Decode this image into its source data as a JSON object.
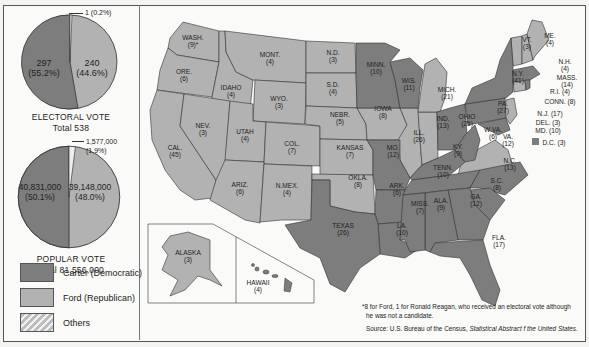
{
  "colors": {
    "carter_democratic": "#7d7d7d",
    "ford_republican": "#b2b2b2",
    "others": "hatched",
    "background": "#fafaf8"
  },
  "electoral_vote": {
    "caption": "ELECTORAL VOTE",
    "total_label": "Total  538",
    "carter": {
      "value": "297",
      "pct": "(55.2%)"
    },
    "ford": {
      "value": "240",
      "pct": "(44.6%)"
    },
    "others": {
      "label": "1 (0.2%)"
    }
  },
  "popular_vote": {
    "caption": "POPULAR VOTE",
    "total_label": "Total  81,556,000",
    "carter": {
      "value": "40,831,000",
      "pct": "(50.1%)"
    },
    "ford": {
      "value": "39,148,000",
      "pct": "(48.0%)"
    },
    "others": {
      "value": "1,577,000",
      "pct": "(1.9%)"
    }
  },
  "legend": [
    {
      "label": "Carter (Democratic)",
      "swatch": "dem"
    },
    {
      "label": "Ford (Republican)",
      "swatch": "rep"
    },
    {
      "label": "Others",
      "swatch": "oth"
    }
  ],
  "states": {
    "wash": {
      "name": "WASH.",
      "ev": "(9)*",
      "winner": "rep"
    },
    "ore": {
      "name": "ORE.",
      "ev": "(6)",
      "winner": "rep"
    },
    "cal": {
      "name": "CAL.",
      "ev": "(45)",
      "winner": "rep"
    },
    "idaho": {
      "name": "IDAHO",
      "ev": "(4)",
      "winner": "rep"
    },
    "nev": {
      "name": "NEV.",
      "ev": "(3)",
      "winner": "rep"
    },
    "mont": {
      "name": "MONT.",
      "ev": "(4)",
      "winner": "rep"
    },
    "wyo": {
      "name": "WYO.",
      "ev": "(3)",
      "winner": "rep"
    },
    "utah": {
      "name": "UTAH",
      "ev": "(4)",
      "winner": "rep"
    },
    "ariz": {
      "name": "ARIZ.",
      "ev": "(6)",
      "winner": "rep"
    },
    "col": {
      "name": "COL.",
      "ev": "(7)",
      "winner": "rep"
    },
    "nmex": {
      "name": "N.MEX.",
      "ev": "(4)",
      "winner": "rep"
    },
    "nd": {
      "name": "N.D.",
      "ev": "(3)",
      "winner": "rep"
    },
    "sd": {
      "name": "S.D.",
      "ev": "(4)",
      "winner": "rep"
    },
    "nebr": {
      "name": "NEBR.",
      "ev": "(5)",
      "winner": "rep"
    },
    "kansas": {
      "name": "KANSAS",
      "ev": "(7)",
      "winner": "rep"
    },
    "okla": {
      "name": "OKLA.",
      "ev": "(8)",
      "winner": "rep"
    },
    "texas": {
      "name": "TEXAS",
      "ev": "(26)",
      "winner": "dem"
    },
    "minn": {
      "name": "MINN.",
      "ev": "(10)",
      "winner": "dem"
    },
    "iowa": {
      "name": "IOWA",
      "ev": "(8)",
      "winner": "rep"
    },
    "mo": {
      "name": "MO.",
      "ev": "(12)",
      "winner": "dem"
    },
    "ark": {
      "name": "ARK.",
      "ev": "(6)",
      "winner": "dem"
    },
    "la": {
      "name": "LA.",
      "ev": "(10)",
      "winner": "dem"
    },
    "wis": {
      "name": "WIS.",
      "ev": "(11)",
      "winner": "dem"
    },
    "ill": {
      "name": "ILL.",
      "ev": "(26)",
      "winner": "rep"
    },
    "mich": {
      "name": "MICH.",
      "ev": "(21)",
      "winner": "rep"
    },
    "ind": {
      "name": "IND.",
      "ev": "(13)",
      "winner": "rep"
    },
    "ohio": {
      "name": "OHIO",
      "ev": "(25)",
      "winner": "dem"
    },
    "ky": {
      "name": "KY.",
      "ev": "(9)",
      "winner": "dem"
    },
    "tenn": {
      "name": "TENN.",
      "ev": "(10)",
      "winner": "dem"
    },
    "miss": {
      "name": "MISS.",
      "ev": "(7)",
      "winner": "dem"
    },
    "ala": {
      "name": "ALA.",
      "ev": "(9)",
      "winner": "dem"
    },
    "ga": {
      "name": "GA.",
      "ev": "(12)",
      "winner": "dem"
    },
    "fla": {
      "name": "FLA.",
      "ev": "(17)",
      "winner": "dem"
    },
    "sc": {
      "name": "S.C.",
      "ev": "(8)",
      "winner": "dem"
    },
    "nc": {
      "name": "N.C.",
      "ev": "(13)",
      "winner": "dem"
    },
    "va": {
      "name": "VA.",
      "ev": "(12)",
      "winner": "rep"
    },
    "wva": {
      "name": "W.VA.",
      "ev": "(6)",
      "winner": "dem"
    },
    "pa": {
      "name": "PA.",
      "ev": "(27)",
      "winner": "dem"
    },
    "ny": {
      "name": "N.Y.",
      "ev": "(41)",
      "winner": "dem"
    },
    "vt": {
      "name": "VT.",
      "ev": "(3)",
      "winner": "rep"
    },
    "me": {
      "name": "ME.",
      "ev": "(4)",
      "winner": "rep"
    },
    "nh": {
      "name": "N.H.",
      "ev": "(4)",
      "winner": "rep"
    },
    "mass": {
      "name": "MASS.",
      "ev": "(14)",
      "winner": "dem"
    },
    "ri": {
      "name": "R.I. (4)",
      "winner": "dem"
    },
    "conn": {
      "name": "CONN. (8)",
      "winner": "rep"
    },
    "nj": {
      "name": "N.J. (17)",
      "winner": "rep"
    },
    "del": {
      "name": "DEL. (3)",
      "winner": "dem"
    },
    "md": {
      "name": "MD. (10)",
      "winner": "dem"
    },
    "dc": {
      "name": "D.C. (3)",
      "winner": "dem"
    },
    "alaska": {
      "name": "ALASKA",
      "ev": "(3)",
      "winner": "rep"
    },
    "hawaii": {
      "name": "HAWAII",
      "ev": "(4)",
      "winner": "dem"
    }
  },
  "footnote": {
    "line1": "*8 for Ford, 1 for Ronald Reagan, who received an electoral vote although",
    "line2": "he was not a candidate.",
    "source_prefix": "Source: U.S. Bureau of the Census, ",
    "source_title": "Statistical Abstract  f the United States."
  }
}
